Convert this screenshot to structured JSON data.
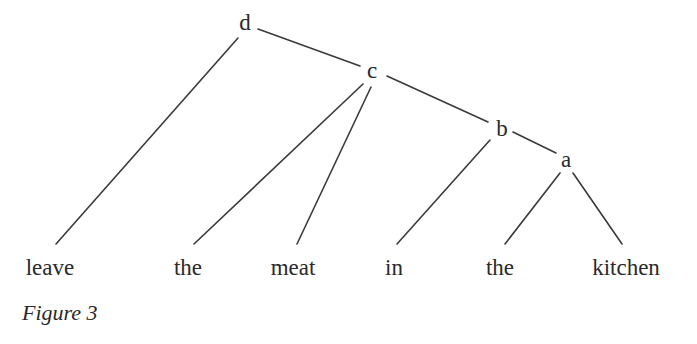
{
  "figure": {
    "caption": "Figure 3",
    "type": "syntax-tree"
  },
  "nodes": [
    {
      "id": "d",
      "label": "d",
      "x": 245,
      "y": 30
    },
    {
      "id": "c",
      "label": "c",
      "x": 372,
      "y": 78
    },
    {
      "id": "b",
      "label": "b",
      "x": 502,
      "y": 136
    },
    {
      "id": "a",
      "label": "a",
      "x": 566,
      "y": 167
    }
  ],
  "leaves": [
    {
      "id": "leaf-leave",
      "label": "leave",
      "x": 50,
      "y": 275
    },
    {
      "id": "leaf-the-1",
      "label": "the",
      "x": 188,
      "y": 275
    },
    {
      "id": "leaf-meat",
      "label": "meat",
      "x": 293,
      "y": 275
    },
    {
      "id": "leaf-in",
      "label": "in",
      "x": 394,
      "y": 275
    },
    {
      "id": "leaf-the-2",
      "label": "the",
      "x": 500,
      "y": 275
    },
    {
      "id": "leaf-kitchen",
      "label": "kitchen",
      "x": 626,
      "y": 275
    }
  ],
  "edges": [
    {
      "from": "d",
      "to": "leave",
      "x1": 238,
      "y1": 38,
      "x2": 56,
      "y2": 244
    },
    {
      "from": "d",
      "to": "c",
      "x1": 258,
      "y1": 29,
      "x2": 360,
      "y2": 66
    },
    {
      "from": "c",
      "to": "the",
      "x1": 363,
      "y1": 84,
      "x2": 194,
      "y2": 244
    },
    {
      "from": "c",
      "to": "meat",
      "x1": 371,
      "y1": 87,
      "x2": 297,
      "y2": 244
    },
    {
      "from": "c",
      "to": "b",
      "x1": 387,
      "y1": 76,
      "x2": 488,
      "y2": 122
    },
    {
      "from": "b",
      "to": "in",
      "x1": 490,
      "y1": 140,
      "x2": 397,
      "y2": 244
    },
    {
      "from": "b",
      "to": "a",
      "x1": 513,
      "y1": 132,
      "x2": 556,
      "y2": 153
    },
    {
      "from": "a",
      "to": "the",
      "x1": 560,
      "y1": 173,
      "x2": 505,
      "y2": 244
    },
    {
      "from": "a",
      "to": "kitchen",
      "x1": 573,
      "y1": 173,
      "x2": 622,
      "y2": 244
    }
  ]
}
